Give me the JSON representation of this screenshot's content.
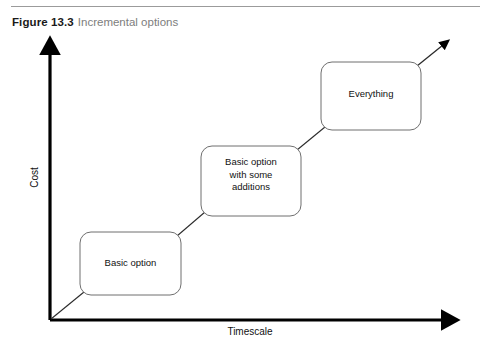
{
  "figure": {
    "label": "Figure 13.3",
    "title": "Incremental options"
  },
  "axes": {
    "x_label": "Timescale",
    "y_label": "Cost"
  },
  "steps": [
    {
      "label": "Basic option"
    },
    {
      "label": "Basic option\nwith some\nadditions"
    },
    {
      "label": "Everything"
    }
  ],
  "colors": {
    "rule": "#9b9b9b",
    "axis": "#000000",
    "box_border": "#6f6f6f",
    "connector": "#2b2b2b",
    "caption_label": "#1a1a1a",
    "caption_title": "#7d7d7d",
    "text": "#111111",
    "background": "#ffffff"
  }
}
